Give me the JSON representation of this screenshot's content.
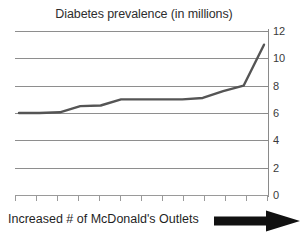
{
  "chart_data": {
    "type": "line",
    "title": "Diabetes prevalence (in millions)",
    "xlabel": "Increased # of McDonald's Outlets",
    "ylabel": "",
    "ylim": [
      0,
      12
    ],
    "yticks": [
      0,
      2,
      4,
      6,
      8,
      10,
      12
    ],
    "ytick_labels": [
      "0",
      "2",
      "4",
      "6",
      "8",
      "10",
      "12"
    ],
    "y_axis_position": "right",
    "grid": true,
    "grid_axis": "y",
    "legend": false,
    "x_tick_count": 13,
    "x_tick_labels": [],
    "series": [
      {
        "name": "Diabetes prevalence",
        "color": "#555555",
        "x": [
          0,
          1,
          2,
          3,
          4,
          5,
          6,
          7,
          8,
          9,
          10,
          11,
          12
        ],
        "values": [
          6.0,
          6.0,
          6.05,
          6.5,
          6.55,
          7.0,
          7.0,
          7.0,
          7.0,
          7.1,
          7.6,
          8.0,
          11.0
        ]
      }
    ],
    "annotations": [
      {
        "type": "arrow",
        "direction": "right",
        "color": "#111111",
        "position": "below-axis-right"
      }
    ]
  },
  "figure": {
    "background_color": "#ffffff",
    "line_color": "#555555",
    "gridline_color": "#8e8e8e",
    "axis_color": "#8a8a8a",
    "text_color": "#2e2e2e"
  }
}
